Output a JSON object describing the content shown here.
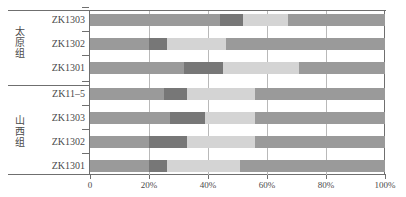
{
  "chart_data": {
    "type": "bar",
    "orientation": "horizontal",
    "stacked": true,
    "normalized_percent": true,
    "title": "",
    "xlabel": "",
    "ylabel": "",
    "xlim": [
      0,
      100
    ],
    "xticks": [
      0,
      20,
      40,
      60,
      80,
      100
    ],
    "xticklabels": [
      "0",
      "20%",
      "40%",
      "60%",
      "80%",
      "100%"
    ],
    "grid": "vertical",
    "legend": "none",
    "categories": [
      "ZK1303",
      "ZK1302",
      "ZK1301",
      "ZK11–5",
      "ZK1303",
      "ZK1302",
      "ZK1301"
    ],
    "groups": [
      {
        "name": "太原组",
        "categories": [
          "ZK1303",
          "ZK1302",
          "ZK1301"
        ]
      },
      {
        "name": "山西组",
        "categories": [
          "ZK11–5",
          "ZK1303",
          "ZK1302",
          "ZK1301"
        ]
      }
    ],
    "series": [
      {
        "name": "segment-1",
        "color": "#9a9a9a",
        "values": [
          44,
          20,
          32,
          25,
          27,
          20,
          20
        ]
      },
      {
        "name": "segment-2",
        "color": "#777777",
        "values": [
          8,
          6,
          13,
          8,
          12,
          13,
          6
        ]
      },
      {
        "name": "segment-3",
        "color": "#d4d4d4",
        "values": [
          15,
          20,
          26,
          23,
          17,
          23,
          25
        ]
      },
      {
        "name": "segment-4",
        "color": "#9a9a9a",
        "values": [
          33,
          54,
          29,
          44,
          44,
          44,
          49
        ]
      }
    ]
  },
  "axis": {
    "ticks": [
      {
        "label": "0",
        "value": 0
      },
      {
        "label": "20%",
        "value": 20
      },
      {
        "label": "40%",
        "value": 40
      },
      {
        "label": "60%",
        "value": 60
      },
      {
        "label": "80%",
        "value": 80
      },
      {
        "label": "100%",
        "value": 100
      }
    ]
  },
  "groups": {
    "taiyuan": {
      "label_chars": [
        "太",
        "原",
        "组"
      ],
      "label": "太原组"
    },
    "shanxi": {
      "label_chars": [
        "山",
        "西",
        "组"
      ],
      "label": "山西组"
    }
  },
  "rows": [
    {
      "label": "ZK1303",
      "group": "太原组",
      "segments": [
        44,
        8,
        15,
        33
      ]
    },
    {
      "label": "ZK1302",
      "group": "太原组",
      "segments": [
        20,
        6,
        20,
        54
      ]
    },
    {
      "label": "ZK1301",
      "group": "太原组",
      "segments": [
        32,
        13,
        26,
        29
      ]
    },
    {
      "label": "ZK11–5",
      "group": "山西组",
      "segments": [
        25,
        8,
        23,
        44
      ]
    },
    {
      "label": "ZK1303",
      "group": "山西组",
      "segments": [
        27,
        12,
        17,
        44
      ]
    },
    {
      "label": "ZK1302",
      "group": "山西组",
      "segments": [
        20,
        13,
        23,
        44
      ]
    },
    {
      "label": "ZK1301",
      "group": "山西组",
      "segments": [
        20,
        6,
        25,
        49
      ]
    }
  ],
  "colors": {
    "segment_medium": "#9a9a9a",
    "segment_dark": "#777777",
    "segment_light": "#d4d4d4",
    "frame": "#6f6f6f",
    "gridline": "#b9b9b9",
    "text": "#4a4a4a",
    "background": "#ffffff"
  }
}
